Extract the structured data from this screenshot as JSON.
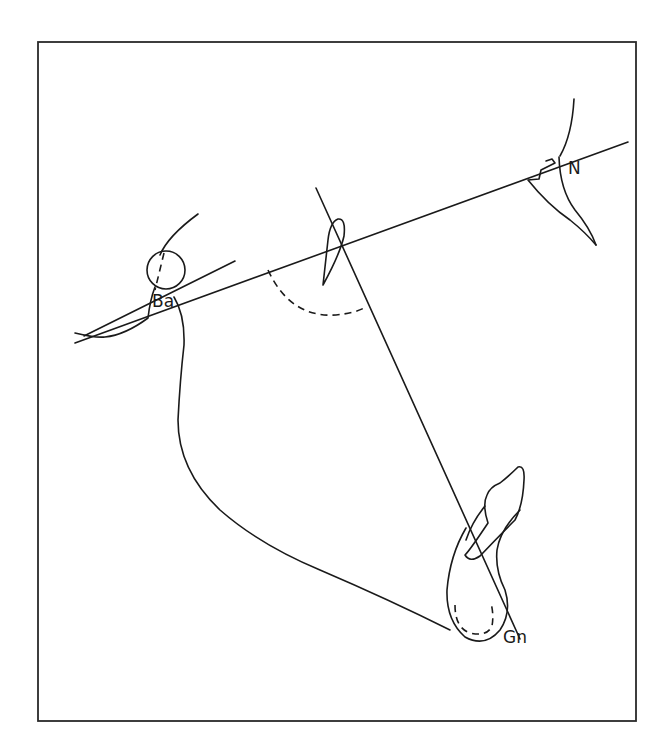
{
  "diagram": {
    "colors": {
      "line": "#1a1a1a",
      "frame": "#2a2a2a",
      "background": "#ffffff"
    },
    "labels": {
      "basion": "Ba",
      "nasion": "N",
      "gnathion": "Gn"
    },
    "elements": [
      {
        "name": "basion-nasion-line",
        "type": "line",
        "style": "solid"
      },
      {
        "name": "cranial-base-tangent-line",
        "type": "line",
        "style": "solid"
      },
      {
        "name": "facial-axis-line",
        "type": "line",
        "style": "solid"
      },
      {
        "name": "facial-axis-angle-arc",
        "type": "arc",
        "style": "dashed"
      },
      {
        "name": "condyle-circle",
        "type": "circle",
        "style": "solid"
      },
      {
        "name": "pterygomaxillary-fissure",
        "type": "outline",
        "style": "solid"
      },
      {
        "name": "nasal-bone-outline",
        "type": "outline",
        "style": "solid"
      },
      {
        "name": "mandible-outline",
        "type": "outline",
        "style": "solid"
      },
      {
        "name": "symphysis-outline",
        "type": "outline",
        "style": "solid"
      },
      {
        "name": "incisor-outline",
        "type": "outline",
        "style": "solid"
      },
      {
        "name": "symphysis-inner-cortex",
        "type": "outline",
        "style": "dashed"
      }
    ]
  }
}
